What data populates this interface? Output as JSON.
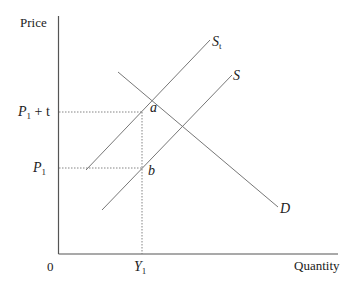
{
  "diagram": {
    "type": "supply-demand-tax",
    "axes": {
      "y_label": "Price",
      "x_label": "Quantity",
      "origin_label": "0"
    },
    "price_levels": {
      "upper": {
        "main": "P",
        "sub": "1",
        "suffix": " + t"
      },
      "lower": {
        "main": "P",
        "sub": "1"
      }
    },
    "quantity_levels": {
      "q1": {
        "main": "Y",
        "sub": "1"
      }
    },
    "curves": {
      "supply_with_tax": {
        "main": "S",
        "sub": "t"
      },
      "supply": {
        "main": "S"
      },
      "demand": {
        "main": "D"
      }
    },
    "points": {
      "a": "a",
      "b": "b"
    },
    "colors": {
      "axis": "#555555",
      "curve": "#777777",
      "text": "#222222",
      "background": "#ffffff"
    }
  }
}
